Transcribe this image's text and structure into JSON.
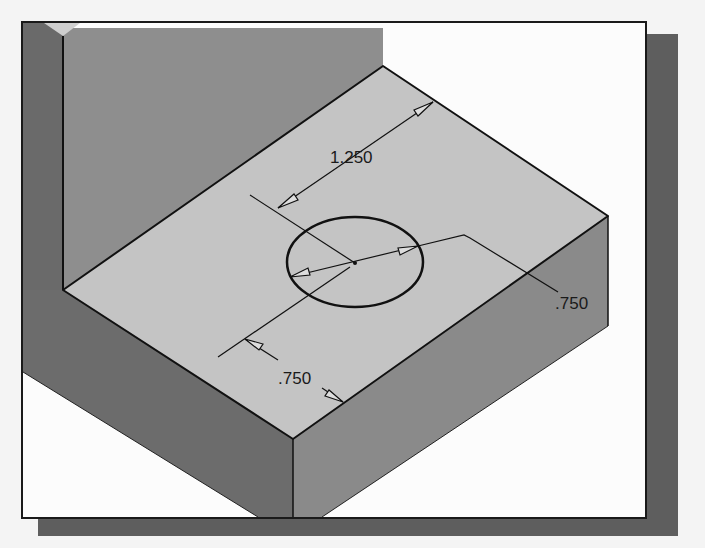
{
  "figure": {
    "colors": {
      "background": "#f4f4f4",
      "frame_fill": "#fcfcfc",
      "frame_border": "#1a1a1a",
      "shadow": "#5e5e5e",
      "top_face": "#c4c4c4",
      "back_wall_face": "#8e8e8e",
      "back_wall_edge_face": "#6a6a6a",
      "left_side_face": "#6c6c6c",
      "front_right_face": "#8a8a8a",
      "wall_top": "#cfcfcf",
      "line": "#111111"
    }
  },
  "dimensions": {
    "horizontal_offset": {
      "label": "1.250"
    },
    "vertical_offset": {
      "label": ".750"
    },
    "diameter": {
      "label": ".750"
    }
  }
}
